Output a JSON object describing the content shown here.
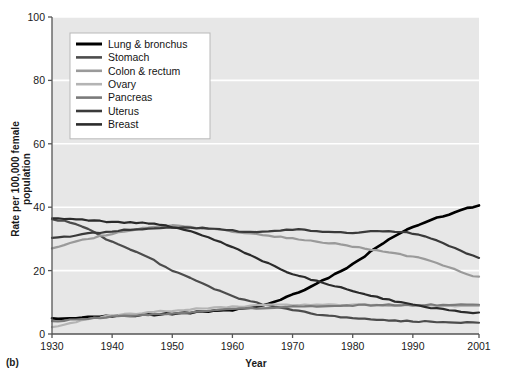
{
  "figure": {
    "panel_label": "(b)",
    "background": "#e7e7e7",
    "gridline_color": "#ffffff",
    "axis_color": "#555555"
  },
  "chart_data": {
    "type": "line",
    "title": "",
    "xlabel": "Year",
    "ylabel": "Rate per 100,000 female population",
    "xlim": [
      1930,
      2001
    ],
    "ylim": [
      0,
      100
    ],
    "xticks": [
      1930,
      1940,
      1950,
      1960,
      1970,
      1980,
      1990,
      2001
    ],
    "yticks": [
      0,
      20,
      40,
      60,
      80,
      100
    ],
    "grid": "horizontal",
    "legend_position": "upper-left-inside",
    "x": [
      1930,
      1935,
      1940,
      1945,
      1950,
      1955,
      1960,
      1965,
      1970,
      1975,
      1980,
      1985,
      1990,
      1995,
      2001
    ],
    "series": [
      {
        "name": "Lung & bronchus",
        "color": "#000000",
        "values": [
          4.8,
          5.2,
          5.6,
          6.0,
          6.4,
          7.0,
          7.6,
          9.2,
          12.4,
          16.8,
          22.0,
          28.6,
          33.8,
          37.2,
          40.5
        ]
      },
      {
        "name": "Stomach",
        "color": "#4c4c4c",
        "values": [
          36.2,
          34.0,
          29.0,
          25.2,
          20.0,
          16.0,
          12.0,
          9.4,
          7.6,
          6.0,
          5.0,
          4.4,
          4.0,
          3.8,
          3.6
        ]
      },
      {
        "name": "Colon & rectum",
        "color": "#9a9a9a",
        "values": [
          27.2,
          29.6,
          31.6,
          33.4,
          34.2,
          33.4,
          32.4,
          31.2,
          30.2,
          29.0,
          27.6,
          26.0,
          24.4,
          21.8,
          18.0
        ]
      },
      {
        "name": "Ovary",
        "color": "#b4b4b4",
        "values": [
          2.2,
          4.2,
          5.8,
          6.6,
          7.4,
          8.0,
          8.6,
          9.0,
          9.2,
          9.2,
          9.2,
          9.0,
          9.0,
          9.0,
          8.8
        ]
      },
      {
        "name": "Pancreas",
        "color": "#7a7a7a",
        "values": [
          4.0,
          4.8,
          5.4,
          6.0,
          6.6,
          7.2,
          7.8,
          8.2,
          8.6,
          8.8,
          9.0,
          9.2,
          9.2,
          9.2,
          9.2
        ]
      },
      {
        "name": "Uterus",
        "color": "#3a3a3a",
        "values": [
          30.2,
          31.4,
          32.4,
          33.2,
          33.6,
          33.4,
          32.6,
          32.2,
          33.0,
          32.4,
          32.0,
          32.4,
          31.6,
          28.6,
          24.2
        ]
      },
      {
        "name": "Breast",
        "color": "#2b2b2b",
        "values": [
          36.4,
          36.0,
          35.4,
          35.0,
          33.8,
          31.2,
          27.4,
          23.0,
          19.0,
          16.2,
          13.6,
          11.2,
          9.2,
          7.8,
          6.6
        ]
      }
    ]
  }
}
